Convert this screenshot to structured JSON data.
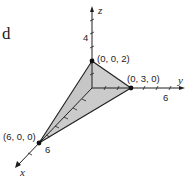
{
  "figure": {
    "corner_letter": "d",
    "axes": {
      "x": {
        "label": "x",
        "tick_label": "6"
      },
      "y": {
        "label": "y",
        "tick_label": "6"
      },
      "z": {
        "label": "z",
        "tick_label": "4"
      }
    },
    "points": [
      {
        "label": "(0, 0, 2)",
        "coords": [
          0,
          0,
          2
        ]
      },
      {
        "label": "(0, 3, 0)",
        "coords": [
          0,
          3,
          0
        ]
      },
      {
        "label": "(6, 0, 0)",
        "coords": [
          6,
          0,
          0
        ]
      }
    ],
    "colors": {
      "face_light": "#d4d4d4",
      "face_dark": "#bcbcbc",
      "line": "#1e1e1e",
      "point": "#111111"
    }
  }
}
